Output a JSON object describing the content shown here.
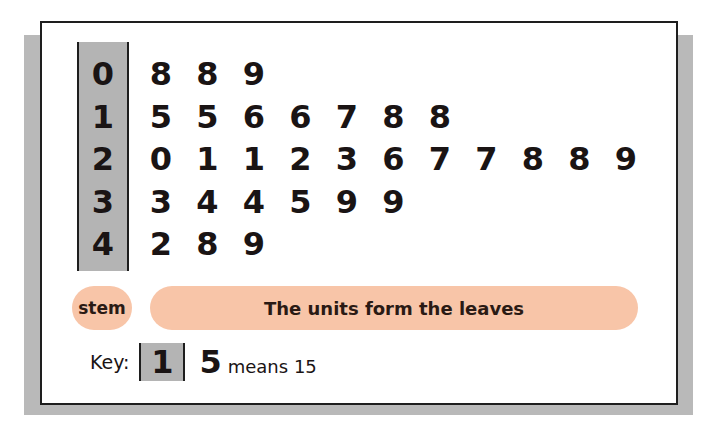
{
  "chart_data": {
    "type": "table",
    "subtype": "stem-and-leaf",
    "rows": [
      {
        "stem": "0",
        "leaves": [
          "8",
          "8",
          "9"
        ]
      },
      {
        "stem": "1",
        "leaves": [
          "5",
          "5",
          "6",
          "6",
          "7",
          "8",
          "8"
        ]
      },
      {
        "stem": "2",
        "leaves": [
          "0",
          "1",
          "1",
          "2",
          "3",
          "6",
          "7",
          "7",
          "8",
          "8",
          "9"
        ]
      },
      {
        "stem": "3",
        "leaves": [
          "3",
          "4",
          "4",
          "5",
          "9",
          "9"
        ]
      },
      {
        "stem": "4",
        "leaves": [
          "2",
          "8",
          "9"
        ]
      }
    ],
    "values": [
      8,
      8,
      9,
      15,
      15,
      16,
      16,
      17,
      18,
      18,
      20,
      21,
      21,
      22,
      23,
      26,
      27,
      27,
      28,
      28,
      29,
      33,
      34,
      34,
      35,
      39,
      39,
      42,
      48,
      49
    ],
    "annotations": {
      "stem_label": "stem",
      "leaves_label": "The units form the leaves"
    },
    "key": {
      "label": "Key:",
      "stem": "1",
      "leaf": "5",
      "meaning": "means 15"
    }
  },
  "colors": {
    "stem_fill": "#b4b4b4",
    "pill_fill": "#f8c5a8",
    "shadow": "#b9b9b9",
    "border": "#1e1e1e"
  }
}
